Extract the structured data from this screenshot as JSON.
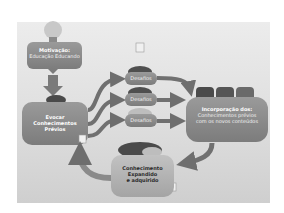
{
  "diagram": {
    "nodes": {
      "motivation": {
        "title": "Motivação:",
        "subtitle": "Educação Educando"
      },
      "prior_knowledge": {
        "line1": "Evocar",
        "line2": "Conhecimentos",
        "line3": "Prévios"
      },
      "challenges": [
        {
          "label": "Desafios"
        },
        {
          "label": "Desafios"
        },
        {
          "label": "Desafios"
        }
      ],
      "incorporation": {
        "title": "Incorporação dos:",
        "line2": "Conhecimentos prévios",
        "line3": "com os novos conteúdos"
      },
      "expanded": {
        "line1": "Conhecimento",
        "line2": "Expandido",
        "line3": "e adquirido"
      }
    },
    "colors": {
      "box_fill": "#8a8a8a",
      "box_fill_light": "#b0b0b0",
      "arrow": "#707070",
      "cloud_dark": "#4a4a4a",
      "background": "#e2e2e2"
    }
  }
}
